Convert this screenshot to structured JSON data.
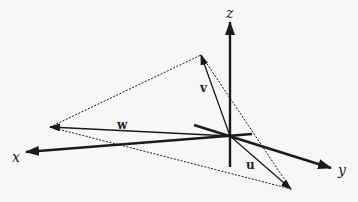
{
  "diagram": {
    "type": "3d-vector-diagram",
    "colors": {
      "ink": "#1a1a1a",
      "background": "#f7f7f7"
    },
    "origin": {
      "x": 230,
      "y": 136
    },
    "axes": [
      {
        "name": "x",
        "label": "x",
        "tip": {
          "x": 26,
          "y": 152
        },
        "tail": {
          "x": 252,
          "y": 134
        },
        "label_pos": {
          "x": 12,
          "y": 162
        }
      },
      {
        "name": "y",
        "label": "y",
        "tip": {
          "x": 331,
          "y": 168
        },
        "tail": {
          "x": 194,
          "y": 125
        },
        "label_pos": {
          "x": 338,
          "y": 175
        }
      },
      {
        "name": "z",
        "label": "z",
        "tip": {
          "x": 230,
          "y": 22
        },
        "tail": {
          "x": 230,
          "y": 167
        },
        "label_pos": {
          "x": 226,
          "y": 18
        }
      }
    ],
    "vectors": [
      {
        "name": "v",
        "label": "v",
        "tip": {
          "x": 201,
          "y": 55
        },
        "label_pos": {
          "x": 200,
          "y": 92
        }
      },
      {
        "name": "w",
        "label": "w",
        "tip": {
          "x": 50,
          "y": 127
        },
        "label_pos": {
          "x": 117,
          "y": 129
        }
      },
      {
        "name": "u",
        "label": "u",
        "tip": {
          "x": 291,
          "y": 189
        },
        "label_pos": {
          "x": 246,
          "y": 169
        }
      }
    ],
    "dashed_triangle": [
      "w",
      "v",
      "u"
    ]
  }
}
